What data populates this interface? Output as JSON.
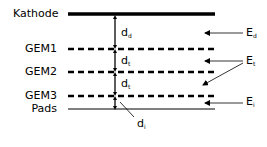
{
  "diagram": {
    "type": "GEM detector layer schematic",
    "layers": [
      {
        "id": "kathode",
        "label": "Kathode",
        "style": "thick-solid"
      },
      {
        "id": "gem1",
        "label": "GEM1",
        "style": "dashed"
      },
      {
        "id": "gem2",
        "label": "GEM2",
        "style": "dashed"
      },
      {
        "id": "gem3",
        "label": "GEM3",
        "style": "dashed"
      },
      {
        "id": "pads",
        "label": "Pads",
        "style": "thin-solid"
      }
    ],
    "distances": [
      {
        "id": "dd",
        "main": "d",
        "sub": "d"
      },
      {
        "id": "dt1",
        "main": "d",
        "sub": "t"
      },
      {
        "id": "dt2",
        "main": "d",
        "sub": "t"
      },
      {
        "id": "di",
        "main": "d",
        "sub": "i"
      }
    ],
    "fields": [
      {
        "id": "Ed",
        "main": "E",
        "sub": "d"
      },
      {
        "id": "Et",
        "main": "E",
        "sub": "t"
      },
      {
        "id": "Ei",
        "main": "E",
        "sub": "i"
      }
    ]
  }
}
